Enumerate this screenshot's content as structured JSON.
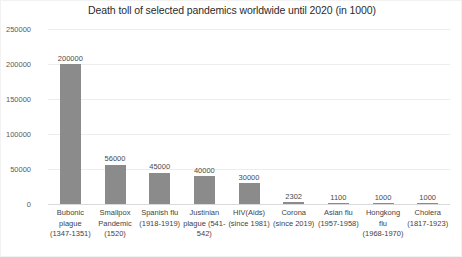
{
  "chart_data": {
    "type": "bar",
    "title": "Death toll of selected pandemics worldwide until 2020 (in 1000)",
    "xlabel": "",
    "ylabel": "",
    "ylim": [
      0,
      250000
    ],
    "yticks": [
      0,
      50000,
      100000,
      150000,
      200000,
      250000
    ],
    "ytick_labels": [
      "0",
      "50000",
      "100000",
      "150000",
      "200000",
      "250000"
    ],
    "grid": true,
    "legend": false,
    "bar_color": "#8b8b8b",
    "categories": [
      "Bubonic plague (1347-1351)",
      "Smallpox Pandemic (1520)",
      "Spanish flu (1918-1919)",
      "Justinian plague (541-542)",
      "HIV(Aids) (since 1981)",
      "Corona (since 2019)",
      "Asian flu (1957-1958)",
      "Hongkong flu (1968-1970)",
      "Cholera (1817-1923)"
    ],
    "category_lines": [
      [
        "Bubonic",
        "plague",
        "(1347-1351)"
      ],
      [
        "Smallpox",
        "Pandemic",
        "(1520)"
      ],
      [
        "Spanish flu",
        "(1918-1919)"
      ],
      [
        "Justinian",
        "plague (541-",
        "542)"
      ],
      [
        "HIV(Aids)",
        "(since 1981)"
      ],
      [
        "Corona",
        "(since 2019)"
      ],
      [
        "Asian flu",
        "(1957-1958)"
      ],
      [
        "Hongkong flu",
        "(1968-1970)"
      ],
      [
        "Cholera",
        "(1817-1923)"
      ]
    ],
    "values": [
      200000,
      56000,
      45000,
      40000,
      30000,
      2302,
      1100,
      1000,
      1000
    ],
    "value_labels": [
      "200000",
      "56000",
      "45000",
      "40000",
      "30000",
      "2302",
      "1100",
      "1000",
      "1000"
    ]
  }
}
